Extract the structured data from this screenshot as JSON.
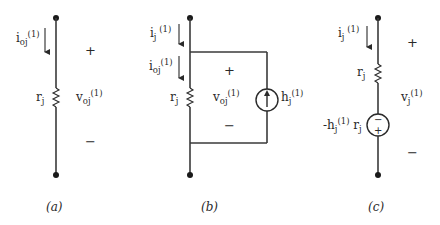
{
  "figure": {
    "panels": [
      {
        "id": "a",
        "caption": "(a)",
        "current_label": {
          "base": "i",
          "sub": "oj",
          "sup": "(1)"
        },
        "resistor_label": {
          "base": "r",
          "sub": "j"
        },
        "voltage_label": {
          "base": "v",
          "sub": "oj",
          "sup": "(1)"
        },
        "plus": "+",
        "minus": "−"
      },
      {
        "id": "b",
        "caption": "(b)",
        "current_top_label": {
          "base": "i",
          "sub": "j",
          "sup": " (1)"
        },
        "current_inner_label": {
          "base": "i",
          "sub": "oj",
          "sup": "(1)"
        },
        "resistor_label": {
          "base": "r",
          "sub": "j"
        },
        "voltage_label": {
          "base": "v",
          "sub": "oj",
          "sup": "(1)"
        },
        "source_label": {
          "base": "h",
          "sub": "j",
          "sup": "(1)"
        },
        "source_type": "current-source-up-arrow",
        "plus": "+",
        "minus": "−"
      },
      {
        "id": "c",
        "caption": "(c)",
        "current_label": {
          "base": "i",
          "sub": "j",
          "sup": " (1)"
        },
        "resistor_label": {
          "base": "r",
          "sub": "j"
        },
        "voltage_label": {
          "base": "v",
          "sub": "j",
          "sup": "(1)"
        },
        "source_label": {
          "prefix": "-h",
          "sub": "j",
          "sup": "(1)",
          "suffix": " r",
          "suffix_sub": "j"
        },
        "source_type": "voltage-source",
        "source_top_sign": "−",
        "source_bottom_sign": "+",
        "plus": "+",
        "minus": "−"
      }
    ]
  }
}
